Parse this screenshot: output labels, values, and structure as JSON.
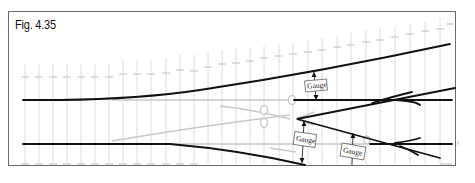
{
  "figure": {
    "title": "Fig. 4.35",
    "labels": {
      "gauge_1": "Gauge",
      "gauge_2": "Gauge",
      "gauge_3": "Gauge"
    },
    "stray_mark": "r"
  },
  "colors": {
    "rail": "#111111",
    "ghost": "#c8c8c8",
    "grid": "#dcdcdc",
    "frame": "#6a6a6a"
  }
}
